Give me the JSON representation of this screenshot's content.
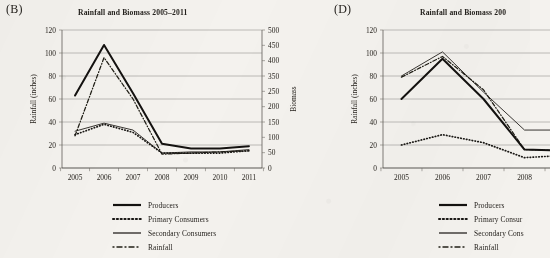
{
  "figure": {
    "panels": [
      {
        "letter": "(B)",
        "title": "Rainfall and Biomass 2005–2011",
        "y_left_label": "Rainfall (inches)",
        "y_right_label": "Biomass",
        "legend": [
          {
            "label": "Producers",
            "style": "solid-thick"
          },
          {
            "label": "Primary Consumers",
            "style": "dotted"
          },
          {
            "label": "Secondary Consumers",
            "style": "solid-thin"
          },
          {
            "label": "Rainfall",
            "style": "dash-dot"
          }
        ]
      },
      {
        "letter": "(D)",
        "title": "Rainfall and Biomass 200",
        "y_left_label": "Rainfall (inches)",
        "y_right_label": "",
        "legend": [
          {
            "label": "Producers",
            "style": "solid-thick"
          },
          {
            "label": "Primary Consur",
            "style": "dotted"
          },
          {
            "label": "Secondary Cons",
            "style": "solid-thin"
          },
          {
            "label": "Rainfall",
            "style": "dash-dot"
          }
        ]
      }
    ]
  },
  "chart_data": [
    {
      "type": "line",
      "panel": "(B)",
      "title": "Rainfall and Biomass 2005–2011",
      "xlabel": "",
      "ylabel": "Rainfall (inches)",
      "y2label": "Biomass",
      "categories": [
        "2005",
        "2006",
        "2007",
        "2008",
        "2009",
        "2010",
        "2011"
      ],
      "ylim": [
        0,
        120
      ],
      "yticks": [
        0,
        20,
        40,
        60,
        80,
        100,
        120
      ],
      "y2lim": [
        0,
        500
      ],
      "y2ticks": [
        0,
        50,
        100,
        150,
        200,
        250,
        350,
        400,
        450,
        500
      ],
      "grid": true,
      "legend_position": "below",
      "series": [
        {
          "name": "Producers",
          "values": [
            63,
            107,
            65,
            21,
            17,
            17,
            19
          ]
        },
        {
          "name": "Primary Consumers",
          "values": [
            29,
            38,
            31,
            13,
            13,
            13,
            15
          ]
        },
        {
          "name": "Secondary Consumers",
          "values": [
            32,
            39,
            33,
            13,
            14,
            14,
            16
          ]
        },
        {
          "name": "Rainfall",
          "values": [
            28,
            96,
            60,
            12,
            13,
            14,
            15
          ]
        }
      ]
    },
    {
      "type": "line",
      "panel": "(D)",
      "title": "Rainfall and Biomass 200",
      "xlabel": "",
      "ylabel": "Rainfall (inches)",
      "y2label": "",
      "categories": [
        "2005",
        "2006",
        "2007",
        "2008",
        "2009"
      ],
      "ylim": [
        0,
        120
      ],
      "yticks": [
        0,
        20,
        40,
        60,
        80,
        100,
        120
      ],
      "grid": true,
      "legend_position": "below",
      "series": [
        {
          "name": "Producers",
          "values": [
            60,
            95,
            60,
            16,
            15
          ]
        },
        {
          "name": "Primary Consumers",
          "values": [
            20,
            29,
            22,
            9,
            11
          ]
        },
        {
          "name": "Secondary Consumers",
          "values": [
            80,
            101,
            66,
            33,
            33
          ]
        },
        {
          "name": "Rainfall",
          "values": [
            79,
            97,
            68,
            16,
            15
          ]
        }
      ]
    }
  ]
}
